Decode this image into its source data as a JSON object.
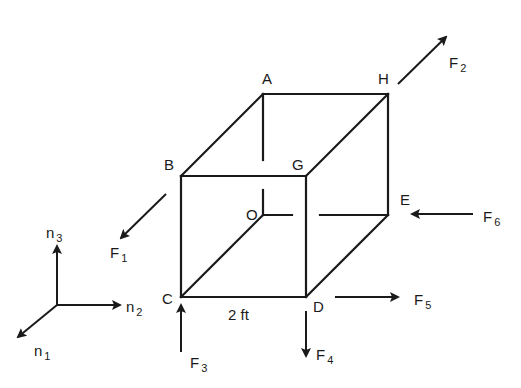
{
  "figure": {
    "type": "cube-force-diagram",
    "dimension_label": "2 ft",
    "vertices": {
      "A": "A",
      "B": "B",
      "C": "C",
      "D": "D",
      "E": "E",
      "G": "G",
      "H": "H",
      "O": "O"
    },
    "forces": [
      {
        "name": "F",
        "sub": "1"
      },
      {
        "name": "F",
        "sub": "2"
      },
      {
        "name": "F",
        "sub": "3"
      },
      {
        "name": "F",
        "sub": "4"
      },
      {
        "name": "F",
        "sub": "5"
      },
      {
        "name": "F",
        "sub": "6"
      }
    ],
    "axes": [
      {
        "name": "n",
        "sub": "1"
      },
      {
        "name": "n",
        "sub": "2"
      },
      {
        "name": "n",
        "sub": "3"
      }
    ]
  },
  "colors": {
    "ink": "#1a1a1a",
    "background": "#ffffff"
  }
}
